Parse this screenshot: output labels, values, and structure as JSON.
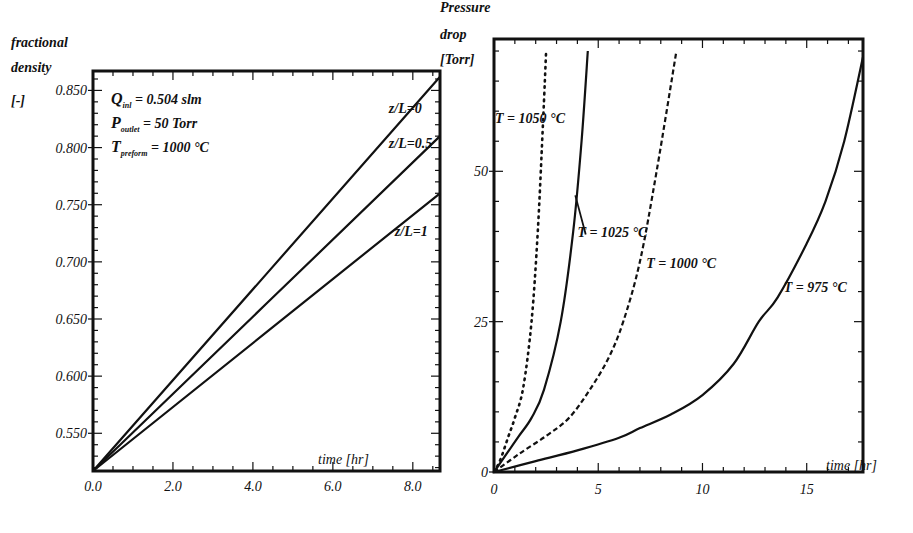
{
  "chart_data": [
    {
      "type": "line",
      "title": "",
      "xlabel": "time [hr]",
      "ylabel": "fractional density [-]",
      "ylabel_lines": [
        "fractional",
        "density",
        "[-]"
      ],
      "xlim": [
        0,
        8.68
      ],
      "ylim": [
        0.517,
        0.867
      ],
      "xticks": [
        0,
        2,
        4,
        6,
        8
      ],
      "xtick_labels": [
        "0.0",
        "2.0",
        "4.0",
        "6.0",
        "8.0"
      ],
      "yticks": [
        0.55,
        0.6,
        0.65,
        0.7,
        0.75,
        0.8,
        0.85
      ],
      "ytick_labels": [
        "0.550",
        "0.600",
        "0.650",
        "0.700",
        "0.750",
        "0.800",
        "0.850"
      ],
      "grid": false,
      "legend": "inline labels",
      "annotations": [
        {
          "main": "Q",
          "sub": "inl",
          "rest": " = 0.504 slm"
        },
        {
          "main": "P",
          "sub": "outlet",
          "rest": " = 50 Torr"
        },
        {
          "main": "T",
          "sub": "preform",
          "rest": " = 1000 °C"
        }
      ],
      "series": [
        {
          "name": "z/L=0",
          "style": "solid",
          "x": [
            0,
            8.68
          ],
          "y": [
            0.517,
            0.862
          ],
          "label_pos": [
            7.4,
            0.83
          ]
        },
        {
          "name": "z/L=0.5",
          "style": "solid",
          "x": [
            0,
            8.68
          ],
          "y": [
            0.517,
            0.81
          ],
          "label_pos": [
            7.4,
            0.8
          ]
        },
        {
          "name": "z/L=1",
          "style": "solid",
          "x": [
            0,
            8.68
          ],
          "y": [
            0.517,
            0.76
          ],
          "label_pos": [
            7.55,
            0.723
          ]
        }
      ]
    },
    {
      "type": "line",
      "title": "",
      "xlabel": "time [hr]",
      "ylabel": "Pressure drop [Torr]",
      "ylabel_lines": [
        "Pressure",
        "drop",
        "[Torr]"
      ],
      "xlim": [
        0,
        17.7
      ],
      "ylim": [
        0,
        72
      ],
      "xticks": [
        0,
        5,
        10,
        15
      ],
      "xtick_labels": [
        "0",
        "5",
        "10",
        "15"
      ],
      "yticks": [
        0,
        25,
        50
      ],
      "ytick_labels": [
        "0",
        "25",
        "50"
      ],
      "grid": false,
      "legend": "inline labels",
      "series": [
        {
          "name": "T = 1050 °C",
          "style": "dotted",
          "x": [
            0,
            0.3,
            0.7,
            1.0,
            1.4,
            1.8,
            2.1,
            2.35,
            2.5
          ],
          "y": [
            0,
            2,
            6,
            9,
            14,
            25,
            40,
            58,
            70
          ],
          "label_pos": [
            0.05,
            58
          ]
        },
        {
          "name": "T = 1025 °C",
          "style": "solid",
          "x": [
            0,
            0.6,
            1.2,
            1.8,
            2.4,
            3.2,
            3.8,
            4.2,
            4.5
          ],
          "y": [
            0,
            3,
            6,
            9,
            13.7,
            25,
            40,
            55,
            70
          ],
          "label_pos": [
            4.0,
            39
          ],
          "leader": [
            [
              3.9,
              46
            ],
            [
              4.4,
              39.5
            ]
          ]
        },
        {
          "name": "T = 1000 °C",
          "style": "dashed",
          "x": [
            0,
            1.2,
            2.5,
            3.6,
            4.6,
            5.5,
            6.2,
            7.0,
            7.8,
            8.75
          ],
          "y": [
            0,
            3,
            6,
            9,
            13.7,
            19,
            25,
            35,
            50,
            70
          ],
          "label_pos": [
            7.3,
            34
          ]
        },
        {
          "name": "T = 975 °C",
          "style": "solid",
          "x": [
            0,
            2,
            4,
            6,
            7,
            8.5,
            10,
            11.5,
            12.7,
            13.6,
            15.0,
            15.9,
            16.8,
            17.7
          ],
          "y": [
            0,
            1.8,
            3.6,
            5.7,
            7.3,
            9.6,
            12.8,
            18,
            25,
            29,
            38,
            45,
            55,
            69
          ],
          "label_pos": [
            13.9,
            30
          ]
        }
      ]
    }
  ]
}
